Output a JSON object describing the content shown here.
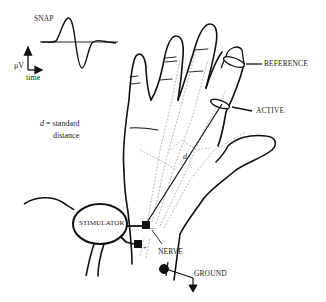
{
  "figure": {
    "type": "nerve-conduction-setup",
    "colors": {
      "ink": "#111111",
      "dotted": "#9a9a9a",
      "background": "#ffffff"
    }
  },
  "snap": {
    "title": "SNAP",
    "y_axis_label": "μV",
    "x_axis_label": "time"
  },
  "legend": {
    "symbol": "d",
    "equals": " = standard",
    "line2": "distance"
  },
  "labels": {
    "reference": "REFERENCE",
    "active": "ACTIVE",
    "stimulator": "STIMULATOR",
    "nerve": "NERVE",
    "ground": "GROUND",
    "distance_marker": "d",
    "cathode_sign": "−",
    "anode_sign": "+"
  }
}
